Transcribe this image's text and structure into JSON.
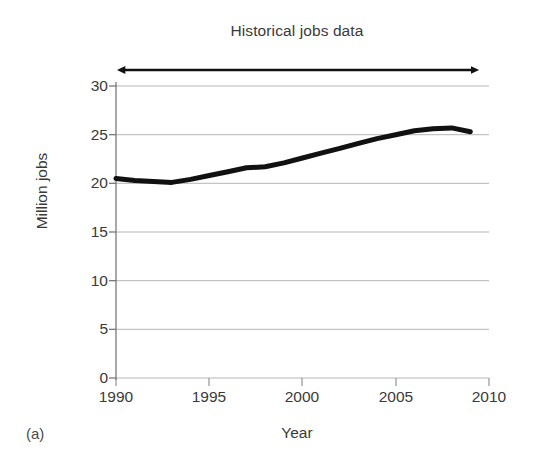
{
  "figure": {
    "panel_caption": "(a)",
    "background_color": "#ffffff"
  },
  "annotation": {
    "arrow_name": "historical-data-span-arrow",
    "style": "double-headed",
    "color": "#111111",
    "spans_x_from": 1990,
    "spans_x_to": 2009
  },
  "chart_data": {
    "type": "line",
    "title": "Historical jobs data",
    "xlabel": "Year",
    "ylabel": "Million jobs",
    "xlim": [
      1990,
      2010
    ],
    "ylim": [
      0,
      30
    ],
    "xticks": [
      1990,
      1995,
      2000,
      2005,
      2010
    ],
    "yticks": [
      0,
      5,
      10,
      15,
      20,
      25,
      30
    ],
    "xtick_labels": [
      "1990",
      "1995",
      "2000",
      "2005",
      "2010"
    ],
    "ytick_labels": [
      "0",
      "5",
      "10",
      "15",
      "20",
      "25",
      "30"
    ],
    "grid": "horizontal",
    "legend": "none",
    "line_color": "#111111",
    "line_width_px": 5,
    "series": [
      {
        "name": "Historical jobs",
        "x": [
          1990,
          1991,
          1992,
          1993,
          1994,
          1995,
          1996,
          1997,
          1998,
          1999,
          2000,
          2001,
          2002,
          2003,
          2004,
          2005,
          2006,
          2007,
          2008,
          2009
        ],
        "values": [
          20.5,
          20.3,
          20.2,
          20.1,
          20.4,
          20.8,
          21.2,
          21.6,
          21.7,
          22.1,
          22.6,
          23.1,
          23.6,
          24.1,
          24.6,
          25.0,
          25.4,
          25.6,
          25.7,
          25.3
        ]
      }
    ]
  }
}
